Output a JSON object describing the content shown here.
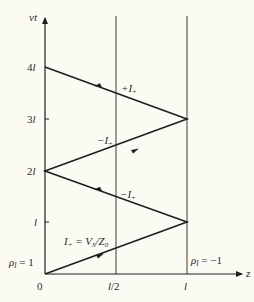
{
  "diagram": {
    "type": "bounce-diagram",
    "axes": {
      "vertical_label": "vt",
      "horizontal_label": "z",
      "vertical_ticks": [
        "4l",
        "3l",
        "2l",
        "l"
      ],
      "horizontal_ticks": [
        "0",
        "l/2",
        "l"
      ]
    },
    "boundary_labels": {
      "left": "ρ_l = 1",
      "left_display": "ρ",
      "left_sub": "l",
      "left_rest": " = 1",
      "right_display": "ρ",
      "right_sub": "l",
      "right_rest": " = −1"
    },
    "wave_labels": {
      "w1_main": "I",
      "w1_sub": "+",
      "w1_rest": " = V",
      "w1_sub2": "S",
      "w1_rest2": "/Z",
      "w1_sub3": "0",
      "w2_main": "−I",
      "w2_sub": "+",
      "w3_main": "−I",
      "w3_sub": "+",
      "w4_main": "+I",
      "w4_sub": "+"
    },
    "segments": [
      {
        "from": [
          0,
          0
        ],
        "to": [
          1,
          1
        ],
        "direction": "right",
        "label": "I+ = VS/Z0"
      },
      {
        "from": [
          1,
          1
        ],
        "to": [
          0,
          2
        ],
        "direction": "left",
        "label": "−I+"
      },
      {
        "from": [
          0,
          2
        ],
        "to": [
          1,
          3
        ],
        "direction": "right",
        "label": "−I+"
      },
      {
        "from": [
          1,
          3
        ],
        "to": [
          0,
          4
        ],
        "direction": "left",
        "label": "+I+"
      }
    ],
    "colors": {
      "background": "#fbfbf3",
      "line": "#1e1e1e",
      "text": "#2a2a2a"
    }
  }
}
